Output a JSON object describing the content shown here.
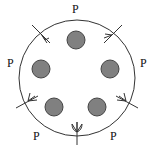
{
  "diagram": {
    "labels": [
      {
        "id": "top",
        "text": "P",
        "x": 72,
        "y": 3
      },
      {
        "id": "left",
        "text": "P",
        "x": 7,
        "y": 57
      },
      {
        "id": "right",
        "text": "P",
        "x": 140,
        "y": 57
      },
      {
        "id": "bottom-left",
        "text": "P",
        "x": 33,
        "y": 130
      },
      {
        "id": "bottom-right",
        "text": "P",
        "x": 110,
        "y": 130
      }
    ],
    "circle": {
      "cx": 77,
      "cy": 78,
      "r": 58,
      "stroke": "#333333"
    },
    "dots": [
      {
        "cx": 76,
        "cy": 40
      },
      {
        "cx": 41,
        "cy": 69
      },
      {
        "cx": 110,
        "cy": 69
      },
      {
        "cx": 54,
        "cy": 107
      },
      {
        "cx": 97,
        "cy": 107
      }
    ],
    "dot_style": {
      "r": 9,
      "fill": "#808080",
      "stroke": "#444444"
    }
  }
}
